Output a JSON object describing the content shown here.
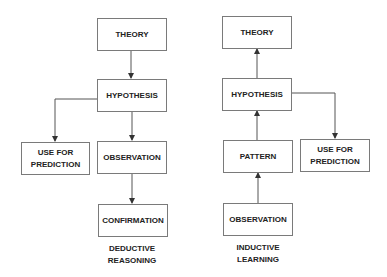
{
  "deductive": {
    "theory": "THEORY",
    "hypothesis": "HYPOTHESIS",
    "prediction": "USE FOR\nPREDICTION",
    "observation": "OBSERVATION",
    "confirmation": "CONFIRMATION",
    "caption": "DEDUCTIVE\nREASONING"
  },
  "inductive": {
    "theory": "THEORY",
    "hypothesis": "HYPOTHESIS",
    "pattern": "PATTERN",
    "prediction": "USE FOR\nPREDICTION",
    "observation": "OBSERVATION",
    "caption": "INDUCTIVE\nLEARNING"
  },
  "colors": {
    "line": "#555555",
    "border": "#7a7a7a",
    "text": "#222222"
  }
}
